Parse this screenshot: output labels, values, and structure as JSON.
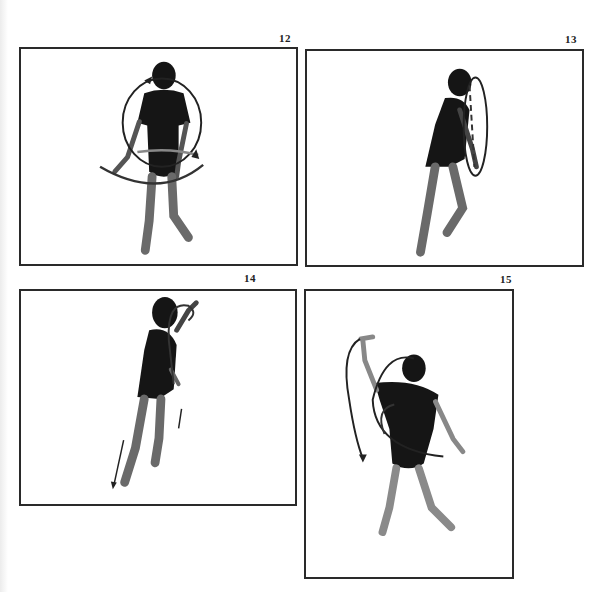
{
  "page": {
    "type": "instructional photo sequence",
    "background": "#ffffff",
    "frame_border_color": "#2a2a2a"
  },
  "figures": [
    {
      "number": "12",
      "description": "Dancer facing front, ribbon circles around body with arrows indicating circular motion"
    },
    {
      "number": "13",
      "description": "Dancer in profile leaning forward, vertical ribbon loop in front with dashed line"
    },
    {
      "number": "14",
      "description": "Dancer in profile, arm raised, ribbon arc from hand downward with arrows toward the floor"
    },
    {
      "number": "15",
      "description": "Dancer facing front, one arm raised overhead, large spiral arcs with arrows around body"
    }
  ]
}
